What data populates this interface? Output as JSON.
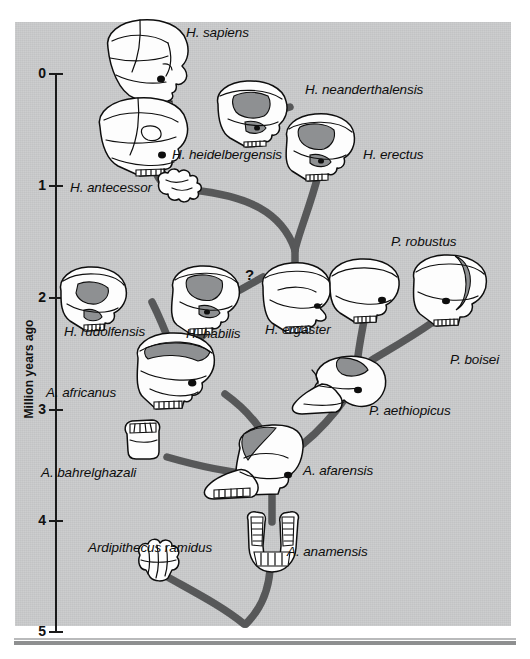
{
  "figure": {
    "panel_background": "#c9cacb",
    "branch_color": "#575859",
    "axis_color": "#1a1a1a"
  },
  "axis": {
    "title": "Million years ago",
    "ticks": [
      "0",
      "1",
      "2",
      "3",
      "4",
      "5"
    ],
    "values": [
      0,
      1,
      2,
      3,
      4,
      5
    ],
    "range": [
      0,
      5
    ],
    "orientation": "vertical-left"
  },
  "annotations": {
    "uncertain_link": "?"
  },
  "species": [
    {
      "name": "H. sapiens",
      "label_x": 186,
      "label_y": 26,
      "fossil": "skull-sapiens"
    },
    {
      "name": "H. neanderthalensis",
      "label_x": 305,
      "label_y": 83,
      "fossil": "skull-neanderthal"
    },
    {
      "name": "H. heidelbergensis",
      "label_x": 172,
      "label_y": 148,
      "fossil": "skull-heidelbergensis"
    },
    {
      "name": "H. erectus",
      "label_x": 363,
      "label_y": 148,
      "fossil": "skull-erectus"
    },
    {
      "name": "H. antecessor",
      "label_x": 70,
      "label_y": 181,
      "fossil": "fragment-antecessor"
    },
    {
      "name": "H. rudolfensis",
      "label_x": 64,
      "label_y": 325,
      "fossil": "skull-rudolfensis"
    },
    {
      "name": "H. habilis",
      "label_x": 186,
      "label_y": 327,
      "fossil": "skull-habilis"
    },
    {
      "name": "H. ergaster",
      "label_x": 265,
      "label_y": 323,
      "fossil": "skull-ergaster"
    },
    {
      "name": "P. robustus",
      "label_x": 391,
      "label_y": 235,
      "fossil": "skull-robustus"
    },
    {
      "name": "P. boisei",
      "label_x": 450,
      "label_y": 353,
      "fossil": "skull-boisei"
    },
    {
      "name": "A. africanus",
      "label_x": 46,
      "label_y": 386,
      "fossil": "skull-africanus"
    },
    {
      "name": "P. aethiopicus",
      "label_x": 369,
      "label_y": 404,
      "fossil": "skull-aethiopicus"
    },
    {
      "name": "A. bahrelghazali",
      "label_x": 41,
      "label_y": 466,
      "fossil": "jaw-bahrelghazali"
    },
    {
      "name": "A. afarensis",
      "label_x": 303,
      "label_y": 464,
      "fossil": "skull-afarensis"
    },
    {
      "name": "A. anamensis",
      "label_x": 287,
      "label_y": 545,
      "fossil": "mandible-anamensis"
    },
    {
      "name": "Ardipithecus ramidus",
      "label_x": 88,
      "label_y": 541,
      "fossil": "fragment-ramidus"
    }
  ],
  "icons": {
    "skull": "skull-icon",
    "jaw": "jaw-icon",
    "mandible": "mandible-icon",
    "fragment": "bone-fragment-icon"
  }
}
